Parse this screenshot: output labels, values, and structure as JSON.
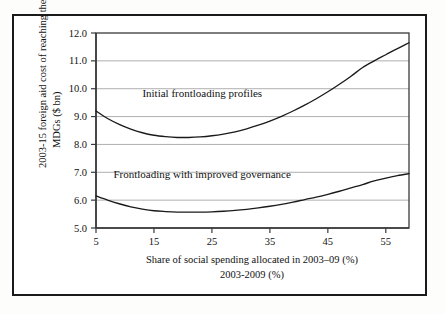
{
  "figure": {
    "frame_color": "#1a1a1a",
    "background": "#ffffff"
  },
  "chart_data": {
    "type": "line",
    "title": "",
    "xlabel": "Share of social spending allocated in 2003–09 (%)",
    "xlabel_line2": "2003-2009 (%)",
    "ylabel": "2003-15 foreign aid cost of reaching the MDGs ($ bn)",
    "ylabel_line1": "2003-15 foreign aid cost of reaching the",
    "ylabel_line2": "MDGs ($ bn)",
    "xlim": [
      5,
      59
    ],
    "ylim": [
      5.0,
      12.0
    ],
    "xticks": [
      5,
      15,
      25,
      35,
      45,
      55
    ],
    "xtick_labels": [
      "5",
      "15",
      "25",
      "35",
      "45",
      "55"
    ],
    "yticks": [
      5.0,
      6.0,
      7.0,
      8.0,
      9.0,
      10.0,
      11.0,
      12.0
    ],
    "ytick_labels": [
      "5.0",
      "6.0",
      "7.0",
      "8.0",
      "9.0",
      "10.0",
      "11.0",
      "12.0"
    ],
    "grid": "horizontal",
    "legend": "none",
    "x": [
      5,
      7,
      9,
      11,
      13,
      15,
      17,
      19,
      21,
      23,
      25,
      27,
      29,
      31,
      33,
      35,
      37,
      39,
      41,
      43,
      45,
      47,
      49,
      51,
      53,
      55,
      57,
      59
    ],
    "series": [
      {
        "name": "Initial frontloading profiles",
        "annotation": "Initial frontloading profiles",
        "annotation_x": 13,
        "annotation_y": 9.72,
        "color": "#1a1a1a",
        "values": [
          9.2,
          8.93,
          8.72,
          8.55,
          8.42,
          8.33,
          8.28,
          8.25,
          8.25,
          8.27,
          8.31,
          8.37,
          8.45,
          8.56,
          8.69,
          8.84,
          9.01,
          9.2,
          9.41,
          9.64,
          9.89,
          10.16,
          10.45,
          10.76,
          11.0,
          11.22,
          11.44,
          11.65
        ]
      },
      {
        "name": "Frontloading with improved governance",
        "annotation": "Frontloading with improved governance",
        "annotation_x": 8,
        "annotation_y": 6.79,
        "color": "#1a1a1a",
        "values": [
          6.15,
          6.0,
          5.87,
          5.76,
          5.68,
          5.62,
          5.59,
          5.57,
          5.57,
          5.57,
          5.58,
          5.6,
          5.63,
          5.67,
          5.72,
          5.78,
          5.85,
          5.93,
          6.02,
          6.11,
          6.21,
          6.32,
          6.44,
          6.56,
          6.69,
          6.79,
          6.88,
          6.95
        ]
      }
    ]
  }
}
